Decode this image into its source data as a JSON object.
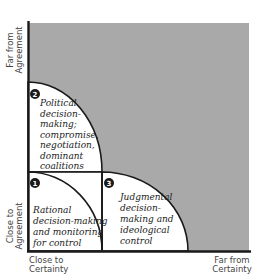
{
  "colors": {
    "shaded_region": "#a9a9a9",
    "lines": "#1a1a1a",
    "white": "#ffffff"
  },
  "axes": {
    "y_top": [
      "Far from",
      "Agreement"
    ],
    "y_bottom": [
      "Close to",
      "Agreement"
    ],
    "x_left": [
      "Close to",
      "Certainty"
    ],
    "x_right": [
      "Far from",
      "Certainty"
    ]
  },
  "quadrants": [
    {
      "number": "1",
      "lines": [
        "Rational",
        "decision-making",
        "and monitoring",
        "for control"
      ]
    },
    {
      "number": "2",
      "lines": [
        "Political",
        "decision-",
        "making;",
        "compromise,",
        "negotiation,",
        "dominant",
        "coalitions"
      ]
    },
    {
      "number": "3",
      "lines": [
        "Judgmental",
        "decision-",
        "making and",
        "ideological",
        "control"
      ]
    }
  ]
}
